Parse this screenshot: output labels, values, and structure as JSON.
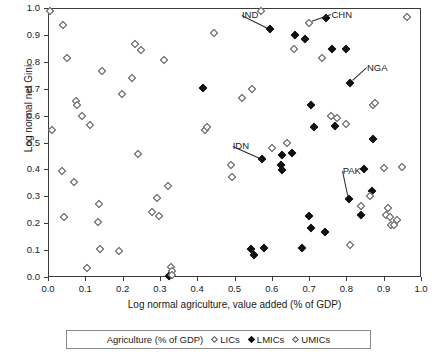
{
  "chart_data": {
    "type": "scatter",
    "title": "",
    "xlabel": "Log normal agriculture, value added (% of GDP)",
    "ylabel": "Log normal net Gini",
    "xlim": [
      0.0,
      1.0
    ],
    "ylim": [
      0.0,
      1.0
    ],
    "xticks": [
      "0.0",
      "0.1",
      "0.2",
      "0.3",
      "0.4",
      "0.5",
      "0.6",
      "0.7",
      "0.8",
      "0.9",
      "1.0"
    ],
    "yticks": [
      "0.0",
      "0.1",
      "0.2",
      "0.3",
      "0.4",
      "0.5",
      "0.6",
      "0.7",
      "0.8",
      "0.9",
      "1.0"
    ],
    "grid": false,
    "legend_position": "bottom",
    "legend_title": "Agriculture (% of GDP)",
    "series": [
      {
        "name": "LICs",
        "marker": "small-open-diamond",
        "points": []
      },
      {
        "name": "LMICs",
        "marker": "filled-diamond",
        "points": [
          [
            0.325,
            0.005
          ],
          [
            0.415,
            0.702
          ],
          [
            0.545,
            0.104
          ],
          [
            0.552,
            0.083
          ],
          [
            0.578,
            0.107
          ],
          [
            0.575,
            0.438
          ],
          [
            0.596,
            0.922
          ],
          [
            0.625,
            0.418
          ],
          [
            0.628,
            0.397
          ],
          [
            0.628,
            0.452
          ],
          [
            0.655,
            0.462
          ],
          [
            0.662,
            0.9
          ],
          [
            0.682,
            0.108
          ],
          [
            0.69,
            0.886
          ],
          [
            0.7,
            0.228
          ],
          [
            0.704,
            0.182
          ],
          [
            0.706,
            0.64
          ],
          [
            0.712,
            0.558
          ],
          [
            0.742,
            0.168
          ],
          [
            0.745,
            0.963
          ],
          [
            0.762,
            0.848
          ],
          [
            0.77,
            0.56
          ],
          [
            0.8,
            0.848
          ],
          [
            0.806,
            0.29
          ],
          [
            0.81,
            0.722
          ],
          [
            0.838,
            0.232
          ],
          [
            0.848,
            0.402
          ],
          [
            0.868,
            0.318
          ],
          [
            0.872,
            0.512
          ]
        ]
      },
      {
        "name": "UMICs",
        "marker": "open-diamond",
        "points": [
          [
            0.005,
            0.988
          ],
          [
            0.012,
            0.545
          ],
          [
            0.038,
            0.395
          ],
          [
            0.04,
            0.935
          ],
          [
            0.042,
            0.222
          ],
          [
            0.052,
            0.815
          ],
          [
            0.07,
            0.352
          ],
          [
            0.076,
            0.655
          ],
          [
            0.078,
            0.638
          ],
          [
            0.092,
            0.6
          ],
          [
            0.105,
            0.032
          ],
          [
            0.112,
            0.565
          ],
          [
            0.135,
            0.203
          ],
          [
            0.138,
            0.27
          ],
          [
            0.14,
            0.105
          ],
          [
            0.145,
            0.765
          ],
          [
            0.19,
            0.098
          ],
          [
            0.198,
            0.68
          ],
          [
            0.225,
            0.74
          ],
          [
            0.232,
            0.868
          ],
          [
            0.24,
            0.456
          ],
          [
            0.248,
            0.845
          ],
          [
            0.278,
            0.24
          ],
          [
            0.292,
            0.293
          ],
          [
            0.298,
            0.228
          ],
          [
            0.31,
            0.805
          ],
          [
            0.322,
            0.338
          ],
          [
            0.33,
            0.038
          ],
          [
            0.332,
            0.022
          ],
          [
            0.332,
            0.008
          ],
          [
            0.42,
            0.548
          ],
          [
            0.425,
            0.558
          ],
          [
            0.445,
            0.908
          ],
          [
            0.49,
            0.418
          ],
          [
            0.492,
            0.372
          ],
          [
            0.52,
            0.665
          ],
          [
            0.548,
            0.7
          ],
          [
            0.57,
            0.988
          ],
          [
            0.6,
            0.478
          ],
          [
            0.64,
            0.5
          ],
          [
            0.66,
            0.848
          ],
          [
            0.7,
            0.945
          ],
          [
            0.735,
            0.815
          ],
          [
            0.76,
            0.6
          ],
          [
            0.775,
            0.592
          ],
          [
            0.8,
            0.568
          ],
          [
            0.81,
            0.12
          ],
          [
            0.838,
            0.265
          ],
          [
            0.862,
            0.302
          ],
          [
            0.872,
            0.64
          ],
          [
            0.878,
            0.648
          ],
          [
            0.9,
            0.405
          ],
          [
            0.905,
            0.23
          ],
          [
            0.912,
            0.258
          ],
          [
            0.918,
            0.222
          ],
          [
            0.92,
            0.192
          ],
          [
            0.928,
            0.192
          ],
          [
            0.935,
            0.212
          ],
          [
            0.948,
            0.408
          ],
          [
            0.962,
            0.965
          ]
        ]
      }
    ],
    "annotations": [
      {
        "label": "CHN",
        "x": 0.7,
        "y": 0.945,
        "label_x": 0.76,
        "label_y": 0.975
      },
      {
        "label": "IND",
        "x": 0.596,
        "y": 0.922,
        "label_x": 0.52,
        "label_y": 0.975
      },
      {
        "label": "NGA",
        "x": 0.81,
        "y": 0.722,
        "label_x": 0.855,
        "label_y": 0.778
      },
      {
        "label": "IDN",
        "x": 0.575,
        "y": 0.438,
        "label_x": 0.495,
        "label_y": 0.487
      },
      {
        "label": "PAK",
        "x": 0.806,
        "y": 0.29,
        "label_x": 0.79,
        "label_y": 0.395
      }
    ]
  },
  "legend": {
    "title": "Agriculture (% of GDP)",
    "entries": [
      {
        "label": "LICs",
        "marker": "open"
      },
      {
        "label": "LMICs",
        "marker": "filled"
      },
      {
        "label": "UMICs",
        "marker": "open"
      }
    ]
  }
}
